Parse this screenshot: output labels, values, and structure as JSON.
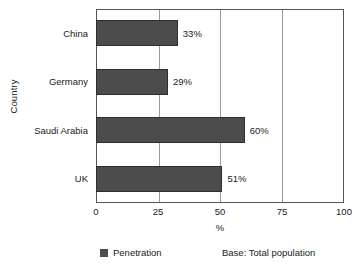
{
  "chart_data": {
    "type": "bar",
    "orientation": "horizontal",
    "title": "",
    "categories": [
      "China",
      "Germany",
      "Saudi Arabia",
      "UK"
    ],
    "values": [
      33,
      29,
      60,
      51
    ],
    "value_labels": [
      "33%",
      "29%",
      "60%",
      "51%"
    ],
    "series": [
      {
        "name": "Penetration",
        "values": [
          33,
          29,
          60,
          51
        ],
        "color": "#4c4c4c"
      }
    ],
    "xlabel": "%",
    "ylabel": "Country",
    "xlim": [
      0,
      100
    ],
    "xticks": [
      0,
      25,
      50,
      75,
      100
    ],
    "xtick_labels": [
      "0",
      "25",
      "50",
      "75",
      "100"
    ],
    "grid": "vertical",
    "legend_position": "bottom-left",
    "annotations": [
      "Base: Total population"
    ]
  },
  "axes": {
    "y_title": "Country",
    "x_title": "%",
    "x_ticks": [
      {
        "label": "0",
        "pos": 0
      },
      {
        "label": "25",
        "pos": 25
      },
      {
        "label": "50",
        "pos": 50
      },
      {
        "label": "75",
        "pos": 75
      },
      {
        "label": "100",
        "pos": 100
      }
    ],
    "categories": [
      {
        "label": "China",
        "value": 33,
        "value_label": "33%"
      },
      {
        "label": "Germany",
        "value": 29,
        "value_label": "29%"
      },
      {
        "label": "Saudi Arabia",
        "value": 60,
        "value_label": "60%"
      },
      {
        "label": "UK",
        "value": 51,
        "value_label": "51%"
      }
    ]
  },
  "legend": {
    "series_label": "Penetration",
    "swatch_color": "#4c4c4c"
  },
  "footer": {
    "base_note": "Base: Total population"
  }
}
